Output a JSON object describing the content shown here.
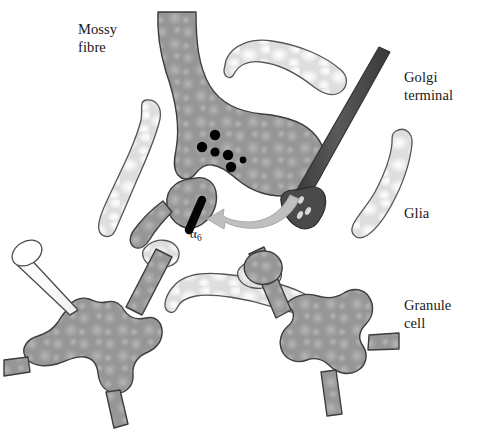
{
  "figure": {
    "background_color": "#ffffff"
  },
  "labels": {
    "mossy_fibre": "Mossy\nfibre",
    "golgi_terminal": "Golgi\nterminal",
    "glia": "Glia",
    "granule_cell": "Granule\ncell",
    "alpha6_symbol": "α",
    "alpha6_subscript": "6"
  },
  "colors": {
    "neuron_gray": "#969696",
    "neuron_gray_dark": "#8a8a8a",
    "neuron_outline": "#3c3c3c",
    "glia_light": "#e0e0e0",
    "glia_highlight": "#fbfbfb",
    "glia_outline": "#555555",
    "golgi_dark": "#4a4a4a",
    "golgi_dark_edge": "#2f2f2f",
    "vesicle_black": "#000000",
    "receptor_black": "#050505",
    "arrow_gray": "#b9b9b9",
    "arrow_outline": "#9a9a9a",
    "pipette_fill": "#fdfdfd",
    "pipette_outline": "#4a4a4a",
    "text_color": "#181818"
  },
  "structures": {
    "mossy_fibre": {
      "name": "Mossy fibre terminal",
      "fill": "#969696",
      "vesicle_count": 6
    },
    "golgi_terminal": {
      "name": "Golgi cell terminal",
      "fill": "#4a4a4a",
      "vesicle_count": 4
    },
    "granule_cell": {
      "name": "Granule cell with dendrites",
      "fill": "#969696"
    },
    "glia_count": 6,
    "receptor": {
      "name": "alpha-6 GABA-A receptor",
      "fill": "#050505"
    },
    "spillover_arrow": {
      "name": "GABA spillover arrow",
      "direction": "right-to-left",
      "fill": "#b9b9b9"
    },
    "pipette": {
      "name": "patch clamp recording pipette",
      "fill": "#fdfdfd"
    }
  },
  "vesicles": [
    {
      "cx": 215,
      "cy": 135,
      "r": 5.2
    },
    {
      "cx": 202,
      "cy": 147,
      "r": 5.2
    },
    {
      "cx": 215,
      "cy": 152,
      "r": 4.6
    },
    {
      "cx": 228,
      "cy": 155,
      "r": 5.2
    },
    {
      "cx": 231,
      "cy": 167,
      "r": 5.2
    },
    {
      "cx": 243,
      "cy": 160,
      "r": 3.4
    }
  ]
}
